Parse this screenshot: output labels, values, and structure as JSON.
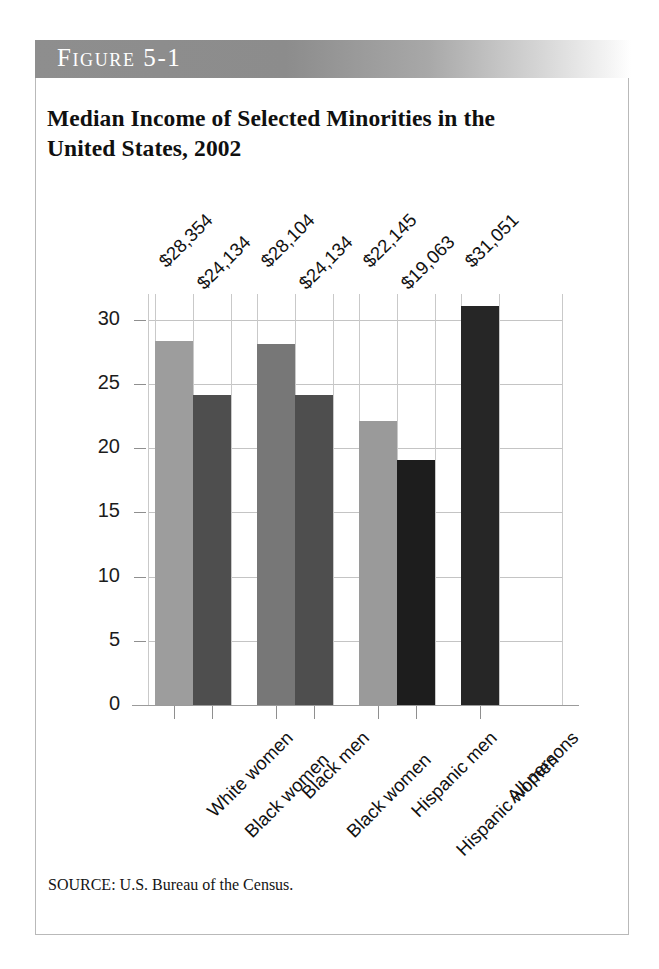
{
  "figure": {
    "banner_label": "Figure 5-1",
    "title": "Median Income of Selected Minorities in the United States, 2002",
    "source": "SOURCE: U.S. Bureau of the Census.",
    "border_color": "#b9b9b9",
    "banner_color": "#8e8e8e"
  },
  "chart_data": {
    "type": "bar",
    "title": "Median Income of Selected Minorities in the United States, 2002",
    "xlabel": "",
    "ylabel": "Thousands of dollars",
    "ylim": [
      0,
      32
    ],
    "yticks": [
      0,
      5,
      10,
      15,
      20,
      25,
      30
    ],
    "ytick_labels": [
      "0",
      "5",
      "10",
      "15",
      "20",
      "25",
      "30"
    ],
    "grid": true,
    "legend": "none",
    "categories": [
      "White women",
      "Black women",
      "Black men",
      "Black women",
      "Hispanic men",
      "Hispanic women",
      "All persons"
    ],
    "values": [
      28.354,
      24.134,
      28.104,
      24.134,
      22.145,
      19.063,
      31.051
    ],
    "data_labels": [
      "$28,354",
      "$24,134",
      "$28,104",
      "$24,134",
      "$22,145",
      "$19,063",
      "$31,051"
    ],
    "bar_colors": [
      "#9d9d9d",
      "#4e4e4e",
      "#777777",
      "#4e4e4e",
      "#9a9a9a",
      "#1d1d1d",
      "#262626"
    ],
    "groups": [
      {
        "label": "White women / Black women",
        "indices": [
          0,
          1
        ]
      },
      {
        "label": "Black men / Black women",
        "indices": [
          2,
          3
        ]
      },
      {
        "label": "Hispanic men / Hispanic women",
        "indices": [
          4,
          5
        ]
      },
      {
        "label": "All persons",
        "indices": [
          6
        ]
      }
    ]
  }
}
